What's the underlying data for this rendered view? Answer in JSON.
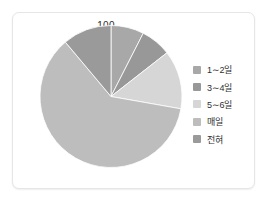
{
  "card": {
    "title": "100",
    "background": "#ffffff",
    "border_color": "#e6e6e6"
  },
  "chart_data": {
    "type": "pie",
    "title": "100",
    "xlabel": "",
    "ylabel": "",
    "legend_position": "right",
    "grid": false,
    "start_angle_deg": 0,
    "direction": "clockwise",
    "categories": [
      "1∼2일",
      "3∼4일",
      "5∼6일",
      "매일",
      "전혀"
    ],
    "values": [
      7.5,
      7.0,
      13.5,
      61.0,
      11.0
    ],
    "units": "%",
    "colors": [
      "#a8a8a8",
      "#989898",
      "#d6d6d6",
      "#bdbdbd",
      "#9a9a9a"
    ],
    "slices": [
      {
        "label": "1∼2일",
        "value": 7.5,
        "start_deg": 0,
        "end_deg": 27,
        "color": "#a8a8a8"
      },
      {
        "label": "3∼4일",
        "value": 7.0,
        "start_deg": 27,
        "end_deg": 52,
        "color": "#989898"
      },
      {
        "label": "5∼6일",
        "value": 13.5,
        "start_deg": 52,
        "end_deg": 100,
        "color": "#d6d6d6"
      },
      {
        "label": "매일",
        "value": 61.0,
        "start_deg": 100,
        "end_deg": 320,
        "color": "#bdbdbd"
      },
      {
        "label": "전혀",
        "value": 11.0,
        "start_deg": 320,
        "end_deg": 360,
        "color": "#9a9a9a"
      }
    ]
  },
  "legend": {
    "items": [
      {
        "label": "1∼2일",
        "color": "#a8a8a8"
      },
      {
        "label": "3∼4일",
        "color": "#989898"
      },
      {
        "label": "5∼6일",
        "color": "#d6d6d6"
      },
      {
        "label": "매일",
        "color": "#bdbdbd"
      },
      {
        "label": "전혀",
        "color": "#9a9a9a"
      }
    ]
  }
}
